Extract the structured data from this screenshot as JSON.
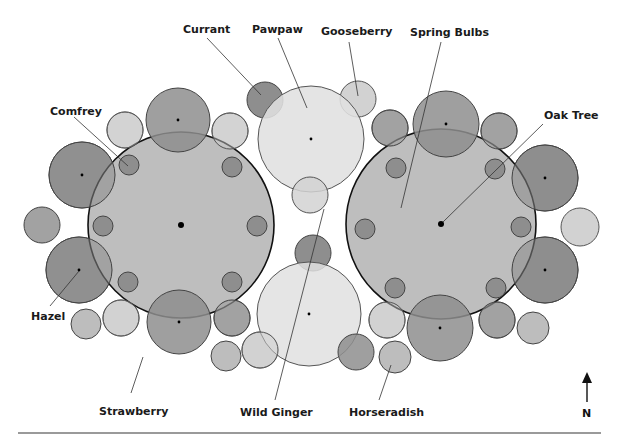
{
  "diagram": {
    "colors": {
      "background": "#ffffff",
      "canopy": "#b9b9b9",
      "dark": "#8e8e8e",
      "medium": "#a2a2a2",
      "light": "#d2d2d2",
      "pale": "#e0e0e0",
      "stroke": "#555555",
      "canopy_stroke": "#111111",
      "rule": "#9a9a9a"
    },
    "labels": {
      "currant": "Currant",
      "pawpaw": "Pawpaw",
      "gooseberry": "Gooseberry",
      "spring_bulbs": "Spring Bulbs",
      "oak_tree": "Oak Tree",
      "comfrey": "Comfrey",
      "hazel": "Hazel",
      "strawberry": "Strawberry",
      "wild_ginger": "Wild Ginger",
      "horseradish": "Horseradish"
    },
    "compass": {
      "label": "N"
    },
    "guilds": [
      {
        "name": "left-guild",
        "center": [
          181,
          225
        ],
        "radius": 93
      },
      {
        "name": "right-guild",
        "center": [
          441,
          224
        ],
        "radius": 95
      }
    ],
    "pawpaws": [
      {
        "center": [
          311,
          139
        ],
        "radius": 53
      },
      {
        "center": [
          309,
          314
        ],
        "radius": 52
      }
    ]
  }
}
